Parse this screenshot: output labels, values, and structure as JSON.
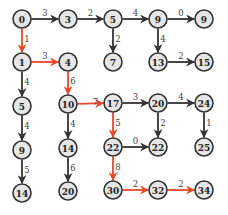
{
  "diagram": {
    "type": "shortest-path-grid-graph",
    "colors": {
      "node_fill": "#e6e6e6",
      "node_stroke": "#333333",
      "edge_default": "#333333",
      "edge_highlight": "#e8482a",
      "text": "#222222"
    },
    "nodes": [
      {
        "id": "n00",
        "label": "0",
        "x": 22,
        "y": 19
      },
      {
        "id": "n01",
        "label": "3",
        "x": 68,
        "y": 19
      },
      {
        "id": "n02",
        "label": "5",
        "x": 113,
        "y": 19
      },
      {
        "id": "n03",
        "label": "9",
        "x": 158,
        "y": 19
      },
      {
        "id": "n04",
        "label": "9",
        "x": 204,
        "y": 19
      },
      {
        "id": "n10",
        "label": "1",
        "x": 22,
        "y": 62
      },
      {
        "id": "n11",
        "label": "4",
        "x": 68,
        "y": 62
      },
      {
        "id": "n12",
        "label": "7",
        "x": 113,
        "y": 62
      },
      {
        "id": "n13",
        "label": "13",
        "x": 158,
        "y": 62
      },
      {
        "id": "n14",
        "label": "15",
        "x": 204,
        "y": 62
      },
      {
        "id": "n20",
        "label": "5",
        "x": 22,
        "y": 106
      },
      {
        "id": "n21",
        "label": "10",
        "x": 68,
        "y": 104
      },
      {
        "id": "n22",
        "label": "17",
        "x": 113,
        "y": 103
      },
      {
        "id": "n23",
        "label": "20",
        "x": 158,
        "y": 103
      },
      {
        "id": "n24",
        "label": "24",
        "x": 204,
        "y": 103
      },
      {
        "id": "n30",
        "label": "9",
        "x": 22,
        "y": 150
      },
      {
        "id": "n31",
        "label": "14",
        "x": 68,
        "y": 148
      },
      {
        "id": "n32",
        "label": "22",
        "x": 113,
        "y": 147
      },
      {
        "id": "n33",
        "label": "22",
        "x": 158,
        "y": 147
      },
      {
        "id": "n34",
        "label": "25",
        "x": 204,
        "y": 147
      },
      {
        "id": "n40",
        "label": "14",
        "x": 22,
        "y": 193
      },
      {
        "id": "n41",
        "label": "20",
        "x": 68,
        "y": 191
      },
      {
        "id": "n42",
        "label": "30",
        "x": 113,
        "y": 190
      },
      {
        "id": "n43",
        "label": "32",
        "x": 158,
        "y": 190
      },
      {
        "id": "n44",
        "label": "34",
        "x": 204,
        "y": 190
      }
    ],
    "edges": [
      {
        "from": "n00",
        "to": "n01",
        "weight": "3",
        "highlight": false
      },
      {
        "from": "n01",
        "to": "n02",
        "weight": "2",
        "highlight": false
      },
      {
        "from": "n02",
        "to": "n03",
        "weight": "4",
        "highlight": false
      },
      {
        "from": "n03",
        "to": "n04",
        "weight": "0",
        "highlight": false
      },
      {
        "from": "n02",
        "to": "n12",
        "weight": "2",
        "highlight": false
      },
      {
        "from": "n03",
        "to": "n13",
        "weight": "4",
        "highlight": false
      },
      {
        "from": "n13",
        "to": "n14",
        "weight": "2",
        "highlight": false
      },
      {
        "from": "n00",
        "to": "n10",
        "weight": "1",
        "highlight": true
      },
      {
        "from": "n10",
        "to": "n11",
        "weight": "3",
        "highlight": true
      },
      {
        "from": "n11",
        "to": "n21",
        "weight": "6",
        "highlight": true
      },
      {
        "from": "n10",
        "to": "n20",
        "weight": "4",
        "highlight": false
      },
      {
        "from": "n20",
        "to": "n30",
        "weight": "4",
        "highlight": false
      },
      {
        "from": "n30",
        "to": "n40",
        "weight": "5",
        "highlight": false
      },
      {
        "from": "n21",
        "to": "n22",
        "weight": "7",
        "highlight": true
      },
      {
        "from": "n21",
        "to": "n31",
        "weight": "4",
        "highlight": false
      },
      {
        "from": "n31",
        "to": "n41",
        "weight": "6",
        "highlight": false
      },
      {
        "from": "n22",
        "to": "n23",
        "weight": "3",
        "highlight": false
      },
      {
        "from": "n23",
        "to": "n24",
        "weight": "4",
        "highlight": false
      },
      {
        "from": "n22",
        "to": "n32",
        "weight": "5",
        "highlight": true
      },
      {
        "from": "n23",
        "to": "n33",
        "weight": "2",
        "highlight": false
      },
      {
        "from": "n24",
        "to": "n34",
        "weight": "1",
        "highlight": false
      },
      {
        "from": "n32",
        "to": "n33",
        "weight": "0",
        "highlight": false
      },
      {
        "from": "n32",
        "to": "n42",
        "weight": "8",
        "highlight": true
      },
      {
        "from": "n42",
        "to": "n43",
        "weight": "2",
        "highlight": true
      },
      {
        "from": "n43",
        "to": "n44",
        "weight": "2",
        "highlight": true
      }
    ],
    "node_radius": 9
  }
}
